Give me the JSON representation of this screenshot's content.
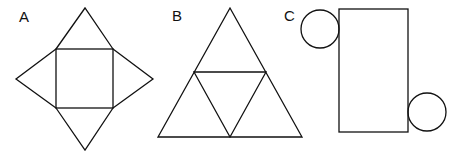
{
  "figures": [
    {
      "label": "A",
      "description": "square pyramid net: central square with four triangles"
    },
    {
      "label": "B",
      "description": "tetrahedron net: large triangle divided into four triangles"
    },
    {
      "label": "C",
      "description": "cylinder net: rectangle with two circles"
    }
  ],
  "colors": {
    "stroke": "#111111",
    "background": "#ffffff"
  }
}
